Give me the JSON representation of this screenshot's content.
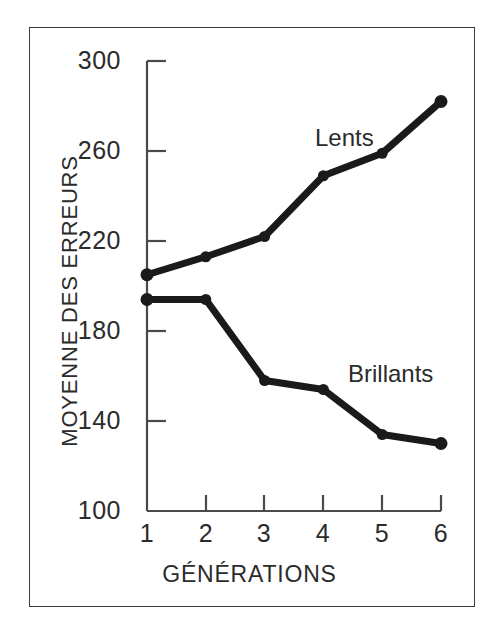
{
  "chart_data": {
    "type": "line",
    "title": "",
    "xlabel": "GÉNÉRATIONS",
    "ylabel": "MOYENNE DES ERREURS",
    "x": [
      1,
      2,
      3,
      4,
      5,
      6
    ],
    "categories": [
      "1",
      "2",
      "3",
      "4",
      "5",
      "6"
    ],
    "xlim": [
      1,
      6
    ],
    "ylim": [
      100,
      300
    ],
    "yticks": [
      300,
      260,
      220,
      180,
      140,
      100
    ],
    "ytick_labels": [
      "300",
      "260",
      "220",
      "180",
      "140",
      "100"
    ],
    "xticks": [
      1,
      2,
      3,
      4,
      5,
      6
    ],
    "xtick_labels": [
      "1",
      "2",
      "3",
      "4",
      "5",
      "6"
    ],
    "grid": false,
    "legend_position": "inline-annotation",
    "series": [
      {
        "name": "Lents",
        "label": "Lents",
        "color": "#1a1a1a",
        "marker": "circle",
        "values": [
          205,
          213,
          222,
          249,
          259,
          282
        ]
      },
      {
        "name": "Brillants",
        "label": "Brillants",
        "color": "#1a1a1a",
        "marker": "circle",
        "values": [
          194,
          194,
          158,
          154,
          134,
          130
        ]
      }
    ],
    "annotations": [
      {
        "text": "Lents",
        "x": 3.9,
        "y": 272
      },
      {
        "text": "Brillants",
        "x": 5.0,
        "y": 172
      }
    ]
  },
  "axes": {
    "y_tick_0": "300",
    "y_tick_1": "260",
    "y_tick_2": "220",
    "y_tick_3": "180",
    "y_tick_4": "140",
    "y_tick_5": "100",
    "x_tick_0": "1",
    "x_tick_1": "2",
    "x_tick_2": "3",
    "x_tick_3": "4",
    "x_tick_4": "5",
    "x_tick_5": "6",
    "x_title": "GÉNÉRATIONS",
    "y_title": "MOYENNE DES ERREURS"
  },
  "labels": {
    "lents": "Lents",
    "brillants": "Brillants"
  },
  "colors": {
    "line": "#1a1a1a",
    "axis": "#4a4a4a",
    "frame": "#3a3a3a",
    "text": "#2b2b2b",
    "background": "#ffffff"
  }
}
